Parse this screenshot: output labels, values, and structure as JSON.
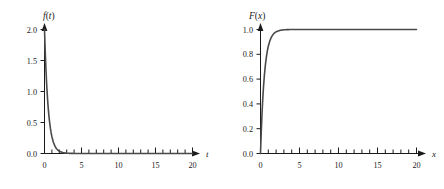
{
  "figure": {
    "background_color": "#ffffff",
    "curve_color": "#4a4a4a",
    "axis_color": "#1a1a1a"
  },
  "chart_data": [
    {
      "type": "line",
      "id": "pdf-plot",
      "title": "f(t)",
      "title_parts": {
        "func": "f",
        "open": "(",
        "var": "t",
        "close": ")"
      },
      "xlabel": "t",
      "ylabel": "f(t)",
      "expression": "f(t) = 2e^(-2t)",
      "xlim": [
        0,
        22
      ],
      "ylim": [
        0,
        2.15
      ],
      "grid": false,
      "legend": null,
      "x_ticks": [
        0,
        5,
        10,
        15,
        20
      ],
      "x_tick_labels": [
        "0",
        "5",
        "10",
        "15",
        "20"
      ],
      "x_minor_step": 1,
      "y_ticks": [
        0.0,
        0.5,
        1.0,
        1.5,
        2.0
      ],
      "y_tick_labels": [
        "0.0",
        "0.5",
        "1.0",
        "1.5",
        "2.0"
      ],
      "x": [
        0,
        0.1,
        0.2,
        0.3,
        0.4,
        0.5,
        0.6,
        0.7,
        0.8,
        0.9,
        1.0,
        1.2,
        1.4,
        1.6,
        1.8,
        2.0,
        2.5,
        3.0,
        3.5,
        4.0,
        5.0,
        6.0,
        8.0,
        10.0,
        12.0,
        15.0,
        18.0,
        20.0
      ],
      "y": [
        2.0,
        1.637,
        1.341,
        1.098,
        0.899,
        0.736,
        0.602,
        0.493,
        0.404,
        0.331,
        0.271,
        0.181,
        0.122,
        0.081,
        0.055,
        0.037,
        0.013,
        0.005,
        0.002,
        0.001,
        0.0,
        0.0,
        0.0,
        0.0,
        0.0,
        0.0,
        0.0,
        0.0
      ]
    },
    {
      "type": "line",
      "id": "cdf-plot",
      "title": "F(x)",
      "title_parts": {
        "func": "F",
        "open": "(",
        "var": "x",
        "close": ")"
      },
      "xlabel": "x",
      "ylabel": "F(x)",
      "expression": "F(x) = 1 - e^(-2x)",
      "xlim": [
        0,
        22
      ],
      "ylim": [
        0,
        1.08
      ],
      "grid": false,
      "legend": null,
      "x_ticks": [
        0,
        5,
        10,
        15,
        20
      ],
      "x_tick_labels": [
        "0",
        "5",
        "10",
        "15",
        "20"
      ],
      "x_minor_step": 1,
      "y_ticks": [
        0.0,
        0.2,
        0.4,
        0.6,
        0.8,
        1.0
      ],
      "y_tick_labels": [
        "0.0",
        "0.2",
        "0.4",
        "0.6",
        "0.8",
        "1.0"
      ],
      "x": [
        0,
        0.1,
        0.2,
        0.3,
        0.4,
        0.5,
        0.6,
        0.7,
        0.8,
        0.9,
        1.0,
        1.2,
        1.4,
        1.6,
        1.8,
        2.0,
        2.5,
        3.0,
        3.5,
        4.0,
        5.0,
        6.0,
        8.0,
        10.0,
        12.0,
        15.0,
        18.0,
        20.0
      ],
      "y": [
        0.0,
        0.181,
        0.33,
        0.451,
        0.551,
        0.632,
        0.699,
        0.753,
        0.798,
        0.835,
        0.865,
        0.909,
        0.939,
        0.959,
        0.973,
        0.982,
        0.993,
        0.998,
        0.999,
        1.0,
        1.0,
        1.0,
        1.0,
        1.0,
        1.0,
        1.0,
        1.0,
        1.0
      ]
    }
  ]
}
